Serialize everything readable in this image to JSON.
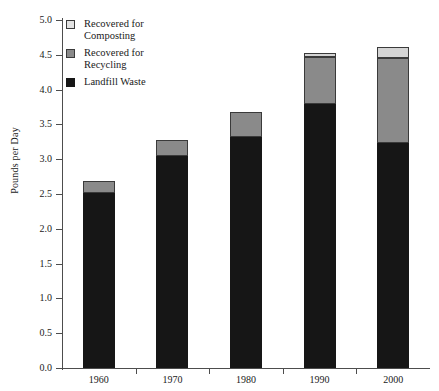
{
  "chart_data": {
    "type": "bar",
    "subtype": "stacked-bar",
    "title": "",
    "xlabel": "",
    "ylabel": "Pounds per Day",
    "categories": [
      "1960",
      "1970",
      "1980",
      "1990",
      "2000"
    ],
    "ylim": [
      0.0,
      5.0
    ],
    "ytick_step": 0.5,
    "yticks": [
      "0.0",
      "0.5",
      "1.0",
      "1.5",
      "2.0",
      "2.5",
      "3.0",
      "3.5",
      "4.0",
      "4.5",
      "5.0"
    ],
    "grid": false,
    "legend_position": "upper-left-inside",
    "stack_order_bottom_to_top": [
      "Landfill Waste",
      "Recovered for Recycling",
      "Recovered for Composting"
    ],
    "series": [
      {
        "name": "Landfill Waste",
        "color": "#161616",
        "values": [
          2.51,
          3.05,
          3.32,
          3.8,
          3.23
        ]
      },
      {
        "name": "Recovered for Recycling",
        "color": "#8a8a8a",
        "values": [
          0.18,
          0.22,
          0.36,
          0.67,
          1.22
        ]
      },
      {
        "name": "Recovered for Composting",
        "color": "#d4d4d4",
        "values": [
          0.0,
          0.0,
          0.0,
          0.06,
          0.16
        ]
      }
    ],
    "cumulative_tops": {
      "landfill": [
        2.51,
        3.05,
        3.32,
        3.8,
        3.23
      ],
      "recycling": [
        2.69,
        3.27,
        3.68,
        4.47,
        4.45
      ],
      "composting": [
        2.69,
        3.27,
        3.68,
        4.53,
        4.61
      ]
    },
    "totals": [
      2.69,
      3.27,
      3.68,
      4.53,
      4.61
    ]
  },
  "axis": {
    "y_title": "Pounds per Day",
    "y_tick_labels": [
      "5.0",
      "4.5",
      "4.0",
      "3.5",
      "3.0",
      "2.5",
      "2.0",
      "1.5",
      "1.0",
      "0.5",
      "0.0"
    ],
    "x_tick_labels": [
      "1960",
      "1970",
      "1980",
      "1990",
      "2000"
    ]
  },
  "legend": {
    "items": [
      {
        "label": "Recovered for\nComposting",
        "swatch": "sw-composting",
        "color": "#e2e2e2"
      },
      {
        "label": "Recovered for\nRecycling",
        "swatch": "sw-recycling",
        "color": "#8a8a8a"
      },
      {
        "label": "Landfill Waste",
        "swatch": "sw-landfill",
        "color": "#161616"
      }
    ]
  }
}
